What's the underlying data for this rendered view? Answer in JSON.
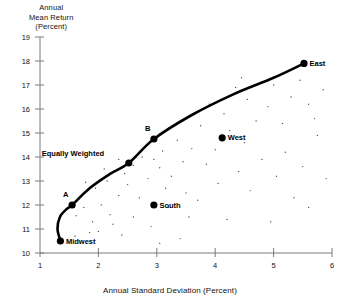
{
  "chart_data": {
    "type": "scatter",
    "title": "",
    "xlabel": "Annual Standard Deviation (Percent)",
    "ylabel": "Annual\nMean Return\n(Percent)",
    "xlim": [
      1,
      6
    ],
    "ylim": [
      10,
      19
    ],
    "xticks": [
      "1",
      "2",
      "3",
      "4",
      "5",
      "6"
    ],
    "yticks": [
      "10",
      "11",
      "12",
      "13",
      "14",
      "15",
      "16",
      "17",
      "18",
      "19"
    ],
    "grid": false,
    "legend": "none",
    "series": [
      {
        "name": "Efficient Frontier",
        "type": "line",
        "points": [
          {
            "x": 1.35,
            "y": 10.5
          },
          {
            "x": 1.3,
            "y": 11.0
          },
          {
            "x": 1.34,
            "y": 11.5
          },
          {
            "x": 1.44,
            "y": 11.8
          },
          {
            "x": 1.55,
            "y": 12.0
          },
          {
            "x": 1.85,
            "y": 12.7
          },
          {
            "x": 2.2,
            "y": 13.3
          },
          {
            "x": 2.52,
            "y": 13.75
          },
          {
            "x": 2.95,
            "y": 14.75
          },
          {
            "x": 3.6,
            "y": 15.75
          },
          {
            "x": 4.3,
            "y": 16.6
          },
          {
            "x": 5.0,
            "y": 17.3
          },
          {
            "x": 5.52,
            "y": 17.9
          }
        ]
      },
      {
        "name": "Labeled Portfolios",
        "type": "scatter",
        "points": [
          {
            "x": 1.35,
            "y": 10.5,
            "label": "Midwest",
            "label_pos": "right"
          },
          {
            "x": 1.55,
            "y": 12.0,
            "label": "A",
            "label_pos": "above-left"
          },
          {
            "x": 2.52,
            "y": 13.75,
            "label": "Equally Weighted",
            "label_pos": "left"
          },
          {
            "x": 2.95,
            "y": 14.75,
            "label": "B",
            "label_pos": "above-left"
          },
          {
            "x": 2.95,
            "y": 12.0,
            "label": "South",
            "label_pos": "right"
          },
          {
            "x": 4.12,
            "y": 14.8,
            "label": "West",
            "label_pos": "right"
          },
          {
            "x": 5.52,
            "y": 17.9,
            "label": "East",
            "label_pos": "right"
          }
        ]
      },
      {
        "name": "Individual Securities Cloud",
        "type": "scatter",
        "points": [
          {
            "x": 1.62,
            "y": 11.55
          },
          {
            "x": 1.75,
            "y": 11.9
          },
          {
            "x": 1.9,
            "y": 11.3
          },
          {
            "x": 1.7,
            "y": 12.35
          },
          {
            "x": 2.05,
            "y": 12.0
          },
          {
            "x": 2.2,
            "y": 11.6
          },
          {
            "x": 1.95,
            "y": 12.7
          },
          {
            "x": 2.35,
            "y": 12.4
          },
          {
            "x": 2.15,
            "y": 13.0
          },
          {
            "x": 2.5,
            "y": 12.85
          },
          {
            "x": 2.7,
            "y": 12.3
          },
          {
            "x": 2.45,
            "y": 13.3
          },
          {
            "x": 2.85,
            "y": 13.1
          },
          {
            "x": 3.05,
            "y": 13.55
          },
          {
            "x": 2.6,
            "y": 13.65
          },
          {
            "x": 3.25,
            "y": 13.2
          },
          {
            "x": 3.45,
            "y": 13.8
          },
          {
            "x": 3.1,
            "y": 14.25
          },
          {
            "x": 3.6,
            "y": 14.35
          },
          {
            "x": 3.85,
            "y": 13.7
          },
          {
            "x": 3.35,
            "y": 14.7
          },
          {
            "x": 4.0,
            "y": 14.3
          },
          {
            "x": 4.25,
            "y": 15.1
          },
          {
            "x": 3.75,
            "y": 15.3
          },
          {
            "x": 4.5,
            "y": 14.6
          },
          {
            "x": 4.7,
            "y": 15.5
          },
          {
            "x": 4.15,
            "y": 15.8
          },
          {
            "x": 4.9,
            "y": 16.1
          },
          {
            "x": 5.15,
            "y": 15.4
          },
          {
            "x": 4.55,
            "y": 16.4
          },
          {
            "x": 5.3,
            "y": 16.5
          },
          {
            "x": 5.0,
            "y": 17.0
          },
          {
            "x": 5.45,
            "y": 17.2
          },
          {
            "x": 5.6,
            "y": 16.2
          },
          {
            "x": 2.25,
            "y": 11.2
          },
          {
            "x": 2.6,
            "y": 11.5
          },
          {
            "x": 2.0,
            "y": 10.9
          },
          {
            "x": 2.9,
            "y": 11.1
          },
          {
            "x": 3.2,
            "y": 11.9
          },
          {
            "x": 3.5,
            "y": 12.5
          },
          {
            "x": 3.15,
            "y": 12.7
          },
          {
            "x": 3.7,
            "y": 12.2
          },
          {
            "x": 4.05,
            "y": 12.9
          },
          {
            "x": 4.4,
            "y": 13.4
          },
          {
            "x": 4.8,
            "y": 13.9
          },
          {
            "x": 5.2,
            "y": 14.2
          },
          {
            "x": 4.6,
            "y": 12.6
          },
          {
            "x": 5.05,
            "y": 13.2
          },
          {
            "x": 5.5,
            "y": 13.6
          },
          {
            "x": 5.75,
            "y": 14.9
          },
          {
            "x": 5.85,
            "y": 16.8
          },
          {
            "x": 1.85,
            "y": 10.85
          },
          {
            "x": 2.4,
            "y": 10.75
          },
          {
            "x": 1.6,
            "y": 10.7
          },
          {
            "x": 3.4,
            "y": 10.6
          },
          {
            "x": 4.2,
            "y": 11.4
          },
          {
            "x": 5.6,
            "y": 11.9
          },
          {
            "x": 2.75,
            "y": 14.0
          },
          {
            "x": 3.9,
            "y": 16.2
          },
          {
            "x": 4.35,
            "y": 16.9
          },
          {
            "x": 5.35,
            "y": 12.3
          },
          {
            "x": 4.95,
            "y": 11.3
          },
          {
            "x": 3.05,
            "y": 10.4
          },
          {
            "x": 2.1,
            "y": 13.5
          },
          {
            "x": 2.35,
            "y": 13.9
          },
          {
            "x": 3.3,
            "y": 15.35
          },
          {
            "x": 5.7,
            "y": 15.6
          },
          {
            "x": 4.45,
            "y": 17.3
          },
          {
            "x": 5.9,
            "y": 13.1
          },
          {
            "x": 1.78,
            "y": 12.95
          },
          {
            "x": 2.95,
            "y": 13.9
          },
          {
            "x": 3.55,
            "y": 11.5
          }
        ]
      }
    ]
  }
}
